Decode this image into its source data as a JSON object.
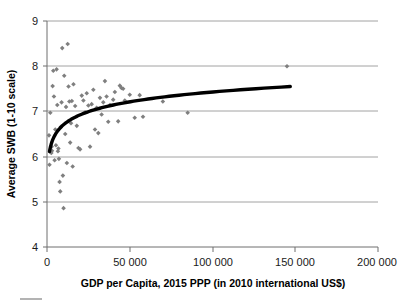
{
  "chart_data": {
    "type": "scatter",
    "title": "",
    "xlabel": "GDP per Capita, 2015 PPP (in 2010 international US$)",
    "ylabel": "Average SWB (1-10 scale)",
    "xlim": [
      0,
      200000
    ],
    "ylim": [
      4,
      9
    ],
    "xticks": [
      0,
      50000,
      100000,
      150000,
      200000
    ],
    "xtick_labels": [
      "0",
      "50 000",
      "100 000",
      "150 000",
      "200 000"
    ],
    "yticks": [
      4,
      5,
      6,
      7,
      8,
      9
    ],
    "ytick_labels": [
      "4",
      "5",
      "6",
      "7",
      "8",
      "9"
    ],
    "grid": "horizontal",
    "legend": "none",
    "marker_style": "diamond",
    "marker_color": "#7f7f7f",
    "trendline_color": "#000000",
    "points": [
      [
        1200,
        6.47
      ],
      [
        1500,
        5.82
      ],
      [
        2000,
        6.97
      ],
      [
        2400,
        6.12
      ],
      [
        2600,
        6.08
      ],
      [
        2800,
        6.22
      ],
      [
        3000,
        6.13
      ],
      [
        3400,
        7.56
      ],
      [
        3800,
        7.9
      ],
      [
        4200,
        7.33
      ],
      [
        4600,
        5.92
      ],
      [
        5000,
        6.6
      ],
      [
        5400,
        6.25
      ],
      [
        5800,
        7.93
      ],
      [
        6200,
        7.14
      ],
      [
        6600,
        6.12
      ],
      [
        6900,
        6.18
      ],
      [
        7200,
        5.95
      ],
      [
        7600,
        5.44
      ],
      [
        8000,
        5.23
      ],
      [
        8400,
        6.66
      ],
      [
        8800,
        7.2
      ],
      [
        9200,
        8.4
      ],
      [
        9600,
        5.58
      ],
      [
        10000,
        4.86
      ],
      [
        10400,
        7.79
      ],
      [
        11000,
        6.5
      ],
      [
        11500,
        7.1
      ],
      [
        12000,
        5.86
      ],
      [
        12500,
        8.49
      ],
      [
        13000,
        7.55
      ],
      [
        13500,
        7.22
      ],
      [
        14000,
        6.31
      ],
      [
        14500,
        6.74
      ],
      [
        15000,
        7.23
      ],
      [
        15500,
        5.78
      ],
      [
        16000,
        7.6
      ],
      [
        17000,
        7.12
      ],
      [
        18000,
        6.68
      ],
      [
        19000,
        6.19
      ],
      [
        20000,
        6.16
      ],
      [
        21000,
        7.35
      ],
      [
        22000,
        7.24
      ],
      [
        23000,
        6.98
      ],
      [
        24000,
        7.4
      ],
      [
        25000,
        7.13
      ],
      [
        26000,
        6.22
      ],
      [
        27000,
        7.16
      ],
      [
        28000,
        7.48
      ],
      [
        29000,
        6.6
      ],
      [
        30000,
        7.08
      ],
      [
        31000,
        6.52
      ],
      [
        32000,
        7.3
      ],
      [
        33000,
        6.93
      ],
      [
        34000,
        7.2
      ],
      [
        35000,
        7.67
      ],
      [
        36000,
        7.33
      ],
      [
        37000,
        6.77
      ],
      [
        38000,
        7.14
      ],
      [
        40000,
        7.26
      ],
      [
        41000,
        7.43
      ],
      [
        43000,
        6.78
      ],
      [
        44000,
        7.57
      ],
      [
        45000,
        7.52
      ],
      [
        46000,
        7.5
      ],
      [
        47000,
        7.24
      ],
      [
        50000,
        7.37
      ],
      [
        53000,
        6.86
      ],
      [
        56000,
        7.36
      ],
      [
        58000,
        6.88
      ],
      [
        70000,
        7.22
      ],
      [
        85000,
        6.97
      ],
      [
        145000,
        8.0
      ]
    ],
    "trendline": {
      "description": "logarithmic best fit curve",
      "x_start": 1500,
      "x_end": 147000,
      "y_start": 6.11,
      "y_end": 7.55
    }
  }
}
